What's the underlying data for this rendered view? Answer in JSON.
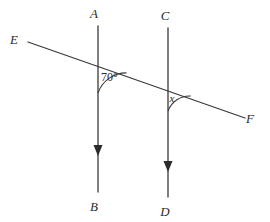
{
  "figure": {
    "type": "geometry-diagram",
    "background_color": "#ffffff",
    "stroke_color": "#3a3a3a",
    "text_color": "#2b2b2b",
    "points": {
      "A": "A",
      "B": "B",
      "C": "C",
      "D": "D",
      "E": "E",
      "F": "F"
    },
    "angles": {
      "known": "70°",
      "unknown": "x"
    },
    "lines": [
      {
        "name": "ray-AB",
        "from": "A",
        "to": "B",
        "direction": "downward",
        "has_arrow": true,
        "x": 98,
        "y_top": 26,
        "y_bottom": 192,
        "arrow_y": 152
      },
      {
        "name": "ray-CD",
        "from": "C",
        "to": "D",
        "direction": "downward",
        "has_arrow": true,
        "x": 168,
        "y_top": 28,
        "y_bottom": 197,
        "arrow_y": 168
      },
      {
        "name": "line-EF",
        "from": "E",
        "to": "F",
        "direction": "down-right",
        "has_arrow": false,
        "x1": 28,
        "y1": 42,
        "x2": 245,
        "y2": 118
      }
    ],
    "label_positions": {
      "A": {
        "x": 94,
        "y": 18
      },
      "B": {
        "x": 94,
        "y": 211
      },
      "C": {
        "x": 164,
        "y": 20
      },
      "D": {
        "x": 164,
        "y": 216
      },
      "E": {
        "x": 14,
        "y": 44
      },
      "F": {
        "x": 248,
        "y": 123
      },
      "angle70": {
        "x": 100,
        "y": 80
      },
      "angleX": {
        "x": 172,
        "y": 102
      }
    },
    "intersections": {
      "first": {
        "x": 98,
        "y": 63
      },
      "second": {
        "x": 168,
        "y": 88
      }
    }
  }
}
